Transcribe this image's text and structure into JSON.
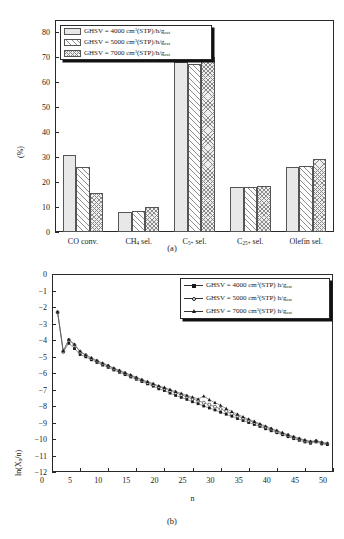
{
  "figure": {
    "panel_a_caption": "(a)",
    "panel_b_caption": "(b)"
  },
  "chart_data": [
    {
      "type": "bar",
      "panel": "(a)",
      "title": "",
      "xlabel": "",
      "ylabel": "(%)",
      "ylim": [
        0,
        85
      ],
      "yticks": [
        0,
        10,
        20,
        30,
        40,
        50,
        60,
        70,
        80
      ],
      "grid": false,
      "legend_position": "top-left",
      "categories": [
        "CO conv.",
        "CH4 sel.",
        "C5+ sel.",
        "C25+ sel.",
        "Olefin sel."
      ],
      "category_labels_html": [
        "CO conv.",
        "CH<sub>4</sub> sel.",
        "C<sub>5+</sub> sel.",
        "C<sub>25+</sub> sel.",
        "Olefin sel."
      ],
      "series": [
        {
          "name": "GHSV = 4000 cm3(STP)/h/gcat",
          "values": [
            31,
            8,
            68,
            18,
            26.2
          ],
          "hatch": "dotted"
        },
        {
          "name": "GHSV = 5000 cm3(STP)/h/gcat",
          "values": [
            26.2,
            8.5,
            67.5,
            18,
            26.5
          ],
          "hatch": "diagonal"
        },
        {
          "name": "GHSV = 7000 cm3(STP)/h/gcat",
          "values": [
            15.6,
            10,
            70.2,
            18.5,
            29.4
          ],
          "hatch": "crosshatch"
        }
      ],
      "legend": [
        {
          "prefix": "GHSV = ",
          "value": "4000",
          "unit_a": "cm",
          "unit_sup": "3",
          "unit_b": "(STP)/h/g",
          "unit_sub": "cat",
          "hatch": "dotted"
        },
        {
          "prefix": "GHSV = ",
          "value": "5000",
          "unit_a": "cm",
          "unit_sup": "3",
          "unit_b": "(STP)/h/g",
          "unit_sub": "cat",
          "hatch": "diagonal"
        },
        {
          "prefix": "GHSV = ",
          "value": "7000",
          "unit_a": "cm",
          "unit_sup": "3",
          "unit_b": "(STP)/h/g",
          "unit_sub": "cat",
          "hatch": "crosshatch"
        }
      ]
    },
    {
      "type": "line",
      "panel": "(b)",
      "title": "",
      "xlabel": "n",
      "ylabel": "ln(Xn/n)",
      "ylabel_html": "ln(X<sub>n</sub>/n)",
      "xlim": [
        0,
        50
      ],
      "ylim": [
        -12,
        0
      ],
      "xticks": [
        0,
        5,
        10,
        15,
        20,
        25,
        30,
        35,
        40,
        45,
        50
      ],
      "yticks": [
        0,
        -1,
        -2,
        -3,
        -4,
        -5,
        -6,
        -7,
        -8,
        -9,
        -10,
        -11,
        -12
      ],
      "grid": false,
      "legend_position": "top-right",
      "x": [
        1,
        2,
        3,
        4,
        5,
        6,
        7,
        8,
        9,
        10,
        11,
        12,
        13,
        14,
        15,
        16,
        17,
        18,
        19,
        20,
        21,
        22,
        23,
        24,
        25,
        26,
        27,
        28,
        29,
        30,
        31,
        32,
        33,
        34,
        35,
        36,
        37,
        38,
        39,
        40,
        41,
        42,
        43,
        44,
        45,
        46,
        47,
        48,
        49
      ],
      "series": [
        {
          "name": "GHSV = 4000 cm3(STP) h/gcat",
          "marker": "filled-square",
          "values": [
            -2.32,
            -4.72,
            -4.2,
            -4.52,
            -4.88,
            -5.02,
            -5.2,
            -5.36,
            -5.52,
            -5.66,
            -5.82,
            -5.96,
            -6.1,
            -6.24,
            -6.38,
            -6.52,
            -6.66,
            -6.8,
            -6.96,
            -7.06,
            -7.22,
            -7.36,
            -7.48,
            -7.6,
            -7.74,
            -7.86,
            -8.0,
            -8.12,
            -8.24,
            -8.38,
            -8.5,
            -8.62,
            -8.76,
            -8.88,
            -9.0,
            -9.12,
            -9.24,
            -9.38,
            -9.5,
            -9.62,
            -9.74,
            -9.86,
            -9.98,
            -10.08,
            -10.18,
            -10.26,
            -10.18,
            -10.3,
            -10.34
          ]
        },
        {
          "name": "GHSV = 5000 cm3(STP) h/gcat",
          "marker": "open-circle",
          "values": [
            -2.32,
            -4.7,
            -4.0,
            -4.3,
            -4.72,
            -4.92,
            -5.12,
            -5.28,
            -5.44,
            -5.58,
            -5.74,
            -5.88,
            -6.02,
            -6.16,
            -6.3,
            -6.44,
            -6.58,
            -6.7,
            -6.84,
            -6.94,
            -7.08,
            -7.2,
            -7.32,
            -7.44,
            -7.56,
            -7.68,
            -7.8,
            -7.92,
            -8.04,
            -8.18,
            -8.32,
            -8.46,
            -8.6,
            -8.74,
            -8.88,
            -9.0,
            -9.14,
            -9.28,
            -9.4,
            -9.54,
            -9.66,
            -9.78,
            -9.9,
            -10.0,
            -10.1,
            -10.18,
            -10.12,
            -10.22,
            -10.28
          ]
        },
        {
          "name": "GHSV = 7000 cm3(STP) h/gcat",
          "marker": "filled-triangle",
          "values": [
            -2.3,
            -4.66,
            -3.96,
            -4.26,
            -4.68,
            -4.9,
            -5.08,
            -5.24,
            -5.4,
            -5.54,
            -5.7,
            -5.84,
            -5.98,
            -6.12,
            -6.26,
            -6.4,
            -6.52,
            -6.64,
            -6.78,
            -6.88,
            -7.0,
            -7.12,
            -7.24,
            -7.36,
            -7.46,
            -7.58,
            -7.4,
            -7.62,
            -7.8,
            -7.96,
            -8.16,
            -8.34,
            -8.5,
            -8.66,
            -8.8,
            -8.94,
            -9.08,
            -9.22,
            -9.36,
            -9.48,
            -9.62,
            -9.74,
            -9.86,
            -9.96,
            -10.06,
            -10.14,
            -10.1,
            -10.2,
            -10.26
          ]
        }
      ],
      "legend": [
        {
          "prefix": "GHSV = ",
          "value": "4000",
          "unit_a": "cm",
          "unit_sup": "3",
          "unit_b": "(STP) h/g",
          "unit_sub": "cat",
          "marker": "filled-square"
        },
        {
          "prefix": "GHSV = ",
          "value": "5000",
          "unit_a": "cm",
          "unit_sup": "3",
          "unit_b": "(STP) h/g",
          "unit_sub": "cat",
          "marker": "open-circle"
        },
        {
          "prefix": "GHSV = ",
          "value": "7000",
          "unit_a": "cm",
          "unit_sup": "3",
          "unit_b": "(STP) h/g",
          "unit_sub": "cat",
          "marker": "filled-triangle"
        }
      ]
    }
  ]
}
